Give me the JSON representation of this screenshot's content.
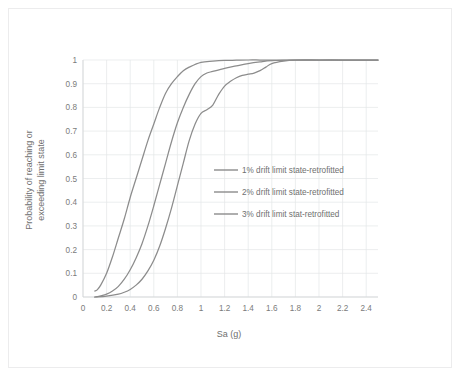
{
  "chart_data": {
    "type": "line",
    "title": "",
    "xlabel": "Sa (g)",
    "ylabel_line1": "Probability of reaching or",
    "ylabel_line2": "exceeding limit state",
    "xlim": [
      0,
      2.5
    ],
    "ylim": [
      0,
      1
    ],
    "grid": true,
    "legend_position": "inside-right-middle",
    "xticks": [
      "0",
      "0.2",
      "0.4",
      "0.6",
      "0.8",
      "1",
      "1.2",
      "1.4",
      "1.6",
      "1.8",
      "2",
      "2.2",
      "2.4"
    ],
    "xtick_values": [
      0,
      0.2,
      0.4,
      0.6,
      0.8,
      1.0,
      1.2,
      1.4,
      1.6,
      1.8,
      2.0,
      2.2,
      2.4
    ],
    "yticks": [
      "0",
      "0.1",
      "0.2",
      "0.3",
      "0.4",
      "0.5",
      "0.6",
      "0.7",
      "0.8",
      "0.9",
      "1"
    ],
    "ytick_values": [
      0,
      0.1,
      0.2,
      0.3,
      0.4,
      0.5,
      0.6,
      0.7,
      0.8,
      0.9,
      1.0
    ],
    "series": [
      {
        "name": "1% drift limit state-retrofitted",
        "color": "#8c8c8c",
        "x": [
          0.1,
          0.12,
          0.15,
          0.2,
          0.25,
          0.3,
          0.35,
          0.4,
          0.45,
          0.5,
          0.55,
          0.6,
          0.65,
          0.7,
          0.75,
          0.8,
          0.85,
          0.9,
          1.0,
          1.1,
          1.2,
          1.3,
          1.4,
          1.5,
          1.6,
          1.8,
          2.0,
          2.2,
          2.4,
          2.5
        ],
        "y": [
          0.025,
          0.03,
          0.05,
          0.1,
          0.17,
          0.25,
          0.33,
          0.42,
          0.5,
          0.58,
          0.66,
          0.73,
          0.8,
          0.86,
          0.9,
          0.93,
          0.955,
          0.97,
          0.99,
          0.995,
          0.998,
          0.999,
          1.0,
          1.0,
          1.0,
          1.0,
          1.0,
          1.0,
          1.0,
          1.0
        ]
      },
      {
        "name": "2% drift limit state-retrofitted",
        "color": "#8c8c8c",
        "x": [
          0.1,
          0.15,
          0.2,
          0.25,
          0.3,
          0.35,
          0.4,
          0.45,
          0.5,
          0.55,
          0.6,
          0.65,
          0.7,
          0.75,
          0.8,
          0.85,
          0.9,
          0.95,
          1.0,
          1.05,
          1.1,
          1.2,
          1.3,
          1.4,
          1.5,
          1.6,
          1.8,
          2.0,
          2.2,
          2.4,
          2.5
        ],
        "y": [
          0.0,
          0.005,
          0.012,
          0.025,
          0.045,
          0.075,
          0.115,
          0.165,
          0.225,
          0.3,
          0.385,
          0.475,
          0.565,
          0.655,
          0.735,
          0.8,
          0.855,
          0.9,
          0.93,
          0.945,
          0.952,
          0.965,
          0.975,
          0.985,
          0.992,
          0.997,
          1.0,
          1.0,
          1.0,
          1.0,
          1.0
        ]
      },
      {
        "name": "3% drift limit stat-retrofitted",
        "color": "#8c8c8c",
        "x": [
          0.1,
          0.2,
          0.3,
          0.35,
          0.4,
          0.45,
          0.5,
          0.55,
          0.6,
          0.65,
          0.7,
          0.75,
          0.8,
          0.85,
          0.9,
          0.95,
          1.0,
          1.05,
          1.1,
          1.15,
          1.2,
          1.25,
          1.3,
          1.35,
          1.4,
          1.45,
          1.5,
          1.55,
          1.6,
          1.7,
          1.8,
          2.0,
          2.2,
          2.4,
          2.5
        ],
        "y": [
          0.0,
          0.004,
          0.012,
          0.02,
          0.032,
          0.05,
          0.075,
          0.11,
          0.155,
          0.215,
          0.29,
          0.375,
          0.47,
          0.565,
          0.66,
          0.73,
          0.775,
          0.79,
          0.81,
          0.855,
          0.89,
          0.91,
          0.925,
          0.935,
          0.94,
          0.945,
          0.955,
          0.97,
          0.985,
          0.995,
          0.999,
          1.0,
          1.0,
          1.0,
          1.0
        ]
      }
    ],
    "legend_entries": [
      "1% drift limit state-retrofitted",
      "2% drift limit state-retrofitted",
      "3% drift limit stat-retrofitted"
    ]
  },
  "colors": {
    "grid": "#e4e6e8",
    "axis": "#d2d4d6",
    "text": "#6f6f6f",
    "frame": "#ececed",
    "series": "#8c8c8c"
  }
}
